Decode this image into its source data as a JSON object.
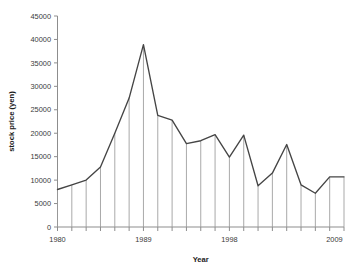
{
  "chart_data": {
    "type": "line",
    "title": "",
    "xlabel": "Year",
    "ylabel": "stock price (yen)",
    "xlim": [
      1980,
      2010
    ],
    "ylim": [
      0,
      45000
    ],
    "grid": false,
    "legend": false,
    "y_ticks": [
      0,
      5000,
      10000,
      15000,
      20000,
      25000,
      30000,
      35000,
      40000,
      45000
    ],
    "y_tick_labels": [
      "0",
      "5000",
      "10000",
      "15000",
      "20000",
      "25000",
      "30000",
      "35000",
      "40000",
      "45000"
    ],
    "x_tick_labels_shown": [
      "1980",
      "1989",
      "1998",
      "2009"
    ],
    "x_tick_label_values": [
      1980,
      1989,
      1998,
      2009
    ],
    "x_ticks_all": [
      1980,
      1981.5,
      1983,
      1984.5,
      1986,
      1987.5,
      1989,
      1990.5,
      1992,
      1993.5,
      1995,
      1996.5,
      1998,
      1999.5,
      2001,
      2002.5,
      2004,
      2005.5,
      2007,
      2008.5,
      2010
    ],
    "marker_style": "none",
    "drop_lines": true,
    "series": [
      {
        "name": "stock price (yen)",
        "color": "#454545",
        "x": [
          1980,
          1981.5,
          1983,
          1984.5,
          1986,
          1987.5,
          1989,
          1990.5,
          1992,
          1993.5,
          1995,
          1996.5,
          1998,
          1999.5,
          2001,
          2002.5,
          2004,
          2005.5,
          2007,
          2008.5,
          2010
        ],
        "values": [
          8000,
          9000,
          10000,
          12800,
          20000,
          27500,
          38900,
          23800,
          22800,
          17800,
          18400,
          19700,
          14900,
          19600,
          8800,
          11500,
          17600,
          9000,
          7200,
          10700,
          10700
        ]
      }
    ]
  },
  "axes": {
    "y_axis_title": "stock price (yen)",
    "x_axis_title": "Year"
  },
  "colors": {
    "line": "#454545",
    "axis": "#8d8d8d",
    "drop": "#9a9a9a",
    "background": "#ffffff",
    "text": "#3a3a3a"
  }
}
